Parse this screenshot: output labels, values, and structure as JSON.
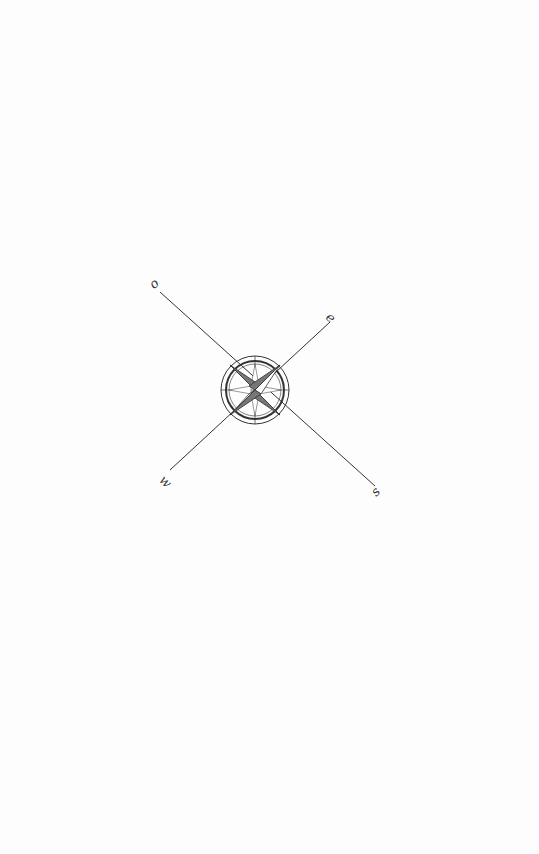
{
  "figure": {
    "type": "compass-rose",
    "labels": {
      "top_left": "o",
      "top_right": "e",
      "bottom_left": "w",
      "bottom_right": "s"
    },
    "colors": {
      "background": "#fdfdfd",
      "ink": "#333333",
      "shade": "#777777"
    }
  }
}
